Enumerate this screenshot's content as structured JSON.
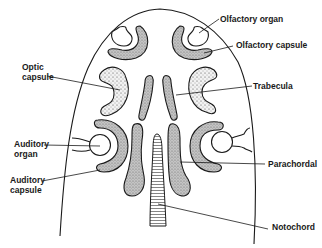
{
  "figure": {
    "labels": {
      "olfactory_organ": "Olfactory organ",
      "olfactory_capsule": "Olfactory capsule",
      "optic_capsule_line1": "Optic",
      "optic_capsule_line2": "capsule",
      "trabecula": "Trabecula",
      "auditory_organ_line1": "Auditory",
      "auditory_organ_line2": "organ",
      "auditory_capsule_line1": "Auditory",
      "auditory_capsule_line2": "capsule",
      "parachordal": "Parachordal",
      "notochord": "Notochord"
    },
    "colors": {
      "ink": "#1a1a1a",
      "cartilage_fill": "#b8b8b8",
      "background": "#ffffff"
    }
  }
}
